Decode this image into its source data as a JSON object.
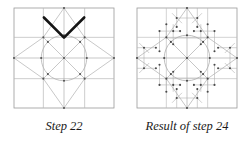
{
  "page": {
    "background_color": "#ffffff",
    "width": 250,
    "height": 142,
    "kind": "quilt-block-construction-diagram-pair"
  },
  "style": {
    "grid_line_color": "#b4b4b4",
    "frame_line_color": "#9a9a9a",
    "construction_line_color": "#a8a8a8",
    "highlight_color": "#1a1a1a",
    "node_color": "#555555",
    "caption_color": "#1a1a1a"
  },
  "panels": [
    {
      "id": "step-22",
      "caption": "Step 22",
      "figure_name": "eight-pointed-star-block-step-22",
      "description": "Square block divided into a three by three grid with an inscribed eight pointed LeMoyne star, a central circle and eight radiating spokes. Two heavy black chevron strokes are drawn across the upper star point.",
      "has_highlight": true,
      "highlight_name": "chevron-highlight-stroke",
      "grid": 3,
      "circle_radius_ratio": 0.205,
      "node_count": 17
    },
    {
      "id": "result-of-step-24",
      "caption": "Result of step 24",
      "figure_name": "eight-pointed-star-block-result-step-24",
      "description": "The same square block with the eight pointed star fully subdivided: each star point and each corner square carries parallel internal division lines with marked intersection dots, plus the central circle and eight radiating spokes.",
      "has_highlight": false,
      "highlight_name": null,
      "grid": 3,
      "circle_radius_ratio": 0.205,
      "node_count": 57
    }
  ]
}
